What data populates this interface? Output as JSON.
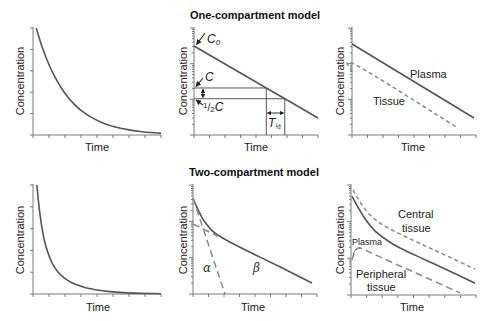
{
  "titles": {
    "one_compartment": "One-compartment model",
    "two_compartment": "Two-compartment model"
  },
  "axis_labels": {
    "y": "Concentration",
    "x": "Time"
  },
  "annotations": {
    "c0_main": "C",
    "c0_sub": "0",
    "c": "C",
    "half_num": "1",
    "half_slash": "/",
    "half_den": "2",
    "half_c": "C",
    "t_half_main": "T",
    "t_half_sub": "½",
    "plasma": "Plasma",
    "tissue": "Tissue",
    "alpha": "α",
    "beta": "β",
    "central_1": "Central",
    "central_2": "tissue",
    "plasma_small": "Plasma",
    "peripheral_1": "Peripheral",
    "peripheral_2": "tissue"
  },
  "colors": {
    "line": "#555555",
    "dashed": "#8a8a8a",
    "axis": "#7a7a7a"
  },
  "chart_data": [
    {
      "type": "line",
      "panel": "one-compartment-linear",
      "title": "",
      "xlabel": "Time",
      "ylabel": "Concentration",
      "yscale": "linear",
      "xlim": [
        0,
        10
      ],
      "ylim": [
        0,
        100
      ],
      "grid": false,
      "series": [
        {
          "name": "Concentration",
          "style": "solid",
          "points": [
            [
              0.25,
              100
            ],
            [
              0.75,
              81
            ],
            [
              1.25,
              65.7
            ],
            [
              1.75,
              53.3
            ],
            [
              2.25,
              43.2
            ],
            [
              2.75,
              35
            ],
            [
              3.25,
              28.4
            ],
            [
              3.75,
              23
            ],
            [
              4.5,
              16.9
            ],
            [
              5.5,
              11
            ],
            [
              6.5,
              7.2
            ],
            [
              7.5,
              4.8
            ],
            [
              8.5,
              3.1
            ],
            [
              9.5,
              2.1
            ],
            [
              10,
              1.7
            ]
          ]
        }
      ]
    },
    {
      "type": "line",
      "panel": "one-compartment-log",
      "title": "One-compartment model",
      "xlabel": "Time",
      "ylabel": "Concentration",
      "yscale": "log",
      "xlim": [
        0,
        10
      ],
      "ylim": [
        1,
        1000
      ],
      "grid": false,
      "series": [
        {
          "name": "Concentration",
          "style": "solid",
          "points": [
            [
              0,
              313
            ],
            [
              10,
              3
            ]
          ]
        }
      ],
      "half_life": {
        "c": 20.8,
        "t_c": 5.83,
        "half_c": 10.4,
        "t_half_c": 7.32,
        "t_half": 1.49
      },
      "annotations": [
        "C0",
        "C",
        "1/2 C",
        "T½"
      ]
    },
    {
      "type": "line",
      "panel": "one-compartment-tissue",
      "title": "",
      "xlabel": "Time",
      "ylabel": "Concentration",
      "yscale": "log",
      "xlim": [
        0,
        10
      ],
      "ylim": [
        1,
        1000
      ],
      "grid": false,
      "series": [
        {
          "name": "Plasma",
          "style": "solid",
          "points": [
            [
              0,
              355
            ],
            [
              9.84,
              3
            ]
          ]
        },
        {
          "name": "Tissue",
          "style": "dash-short",
          "points": [
            [
              0,
              58.5
            ],
            [
              0.32,
              92
            ],
            [
              8.4,
              1.68
            ]
          ]
        }
      ]
    },
    {
      "type": "line",
      "panel": "two-compartment-linear",
      "title": "",
      "xlabel": "Time",
      "ylabel": "Concentration",
      "yscale": "linear",
      "xlim": [
        0,
        10
      ],
      "ylim": [
        0,
        100
      ],
      "grid": false,
      "series": [
        {
          "name": "Concentration",
          "style": "solid",
          "points": [
            [
              0.3,
              100
            ],
            [
              0.5,
              77.2
            ],
            [
              0.75,
              57.4
            ],
            [
              1,
              44.1
            ],
            [
              1.5,
              28.2
            ],
            [
              2,
              19.5
            ],
            [
              2.5,
              14.2
            ],
            [
              3,
              10.6
            ],
            [
              4,
              6.2
            ],
            [
              5,
              3.7
            ],
            [
              6,
              2.2
            ],
            [
              7,
              1.3
            ],
            [
              8,
              0.8
            ],
            [
              9,
              0.47
            ],
            [
              10,
              0.28
            ]
          ]
        }
      ]
    },
    {
      "type": "line",
      "panel": "two-compartment-log",
      "title": "Two-compartment model",
      "xlabel": "Time",
      "ylabel": "Concentration",
      "yscale": "log",
      "xlim": [
        0,
        10
      ],
      "ylim": [
        1,
        1000
      ],
      "grid": false,
      "series": [
        {
          "name": "Concentration",
          "style": "solid",
          "points": [
            [
              0,
              436
            ],
            [
              0.25,
              272
            ],
            [
              0.5,
              178
            ],
            [
              0.75,
              123.5
            ],
            [
              1,
              90.8
            ],
            [
              1.5,
              57.5
            ],
            [
              2,
              42
            ],
            [
              3,
              26.6
            ],
            [
              5,
              12.1
            ],
            [
              7,
              5.6
            ],
            [
              9.6,
              2.0
            ]
          ]
        },
        {
          "name": "α phase",
          "style": "dash-long",
          "points": [
            [
              0,
              436
            ],
            [
              2.58,
              1
            ]
          ]
        },
        {
          "name": "β phase (extrapolated)",
          "style": "dash-long",
          "points": [
            [
              0,
              84.4
            ],
            [
              2,
              38.8
            ]
          ]
        }
      ]
    },
    {
      "type": "line",
      "panel": "two-compartment-tissue",
      "title": "",
      "xlabel": "Time",
      "ylabel": "Concentration",
      "yscale": "log",
      "xlim": [
        0,
        10
      ],
      "ylim": [
        1,
        1000
      ],
      "grid": false,
      "series": [
        {
          "name": "Central tissue",
          "style": "dash-short",
          "points": [
            [
              0.16,
              731
            ],
            [
              0.5,
              453
            ],
            [
              1,
              249
            ],
            [
              1.5,
              156
            ],
            [
              2,
              110
            ],
            [
              3,
              66.4
            ],
            [
              5,
              30.7
            ],
            [
              7,
              14.9
            ],
            [
              9.92,
              5.1
            ]
          ]
        },
        {
          "name": "Plasma",
          "style": "solid",
          "points": [
            [
              0.08,
              501
            ],
            [
              0.5,
              268
            ],
            [
              1,
              138.5
            ],
            [
              1.5,
              80.6
            ],
            [
              2,
              52.7
            ],
            [
              3,
              29.2
            ],
            [
              4,
              18.6
            ],
            [
              6,
              8.9
            ],
            [
              8,
              4.3
            ],
            [
              9.92,
              2.1
            ]
          ]
        },
        {
          "name": "Peripheral tissue",
          "style": "dash-long",
          "points": [
            [
              0.08,
              9
            ],
            [
              0.3,
              15
            ],
            [
              0.72,
              19.2
            ],
            [
              2,
              12.2
            ],
            [
              4,
              6.0
            ],
            [
              6,
              3.0
            ],
            [
              8.72,
              1.14
            ]
          ]
        }
      ]
    }
  ]
}
